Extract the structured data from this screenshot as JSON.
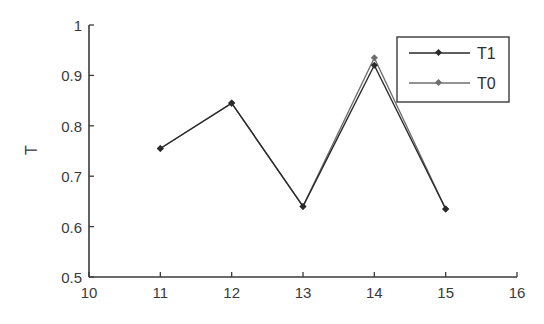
{
  "chart_data": {
    "type": "line",
    "title": "",
    "xlabel": "",
    "ylabel": "T",
    "xlim": [
      10,
      16
    ],
    "ylim": [
      0.5,
      1
    ],
    "xticks": [
      10,
      11,
      12,
      13,
      14,
      15,
      16
    ],
    "yticks": [
      0.5,
      0.6,
      0.7,
      0.8,
      0.9,
      1
    ],
    "ytick_labels": [
      "0.5",
      "0.6",
      "0.7",
      "0.8",
      "0.9",
      "1"
    ],
    "grid": false,
    "legend_position": "upper right",
    "x": [
      11,
      12,
      13,
      14,
      15
    ],
    "series": [
      {
        "name": "T1",
        "values": [
          0.755,
          0.845,
          0.64,
          0.92,
          0.635
        ],
        "color": "#2a2a2a"
      },
      {
        "name": "T0",
        "values": [
          0.755,
          0.845,
          0.64,
          0.935,
          0.635
        ],
        "color": "#6e6e6e"
      }
    ]
  },
  "legend": {
    "items": [
      {
        "label": "T1"
      },
      {
        "label": "T0"
      }
    ]
  },
  "colors": {
    "axis": "#3a3a3a",
    "series_t1": "#2a2a2a",
    "series_t0": "#6e6e6e",
    "background": "#ffffff"
  }
}
